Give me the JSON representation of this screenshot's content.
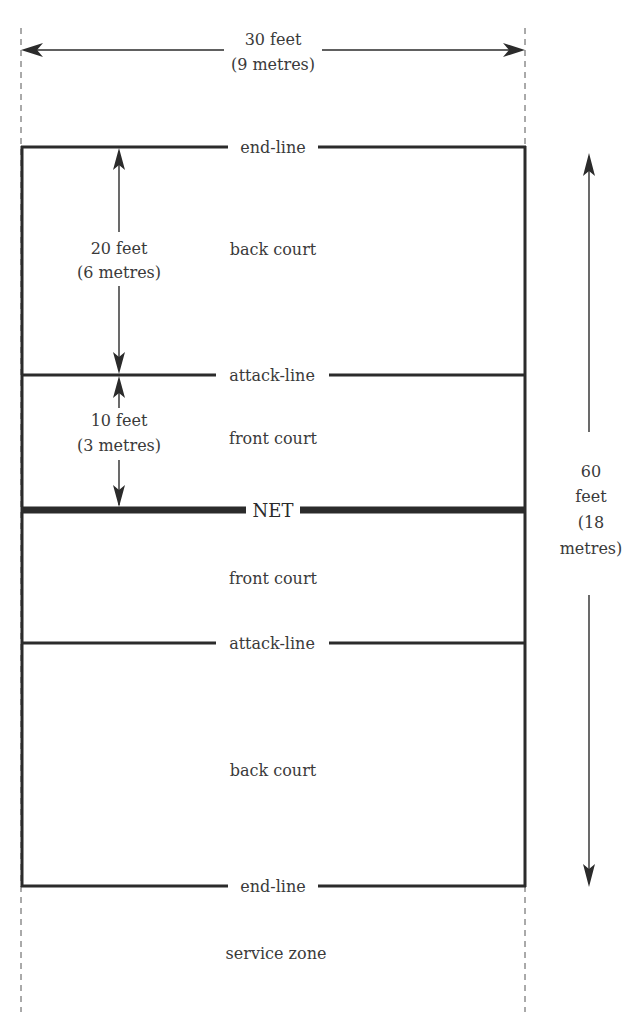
{
  "diagram": {
    "width_dimension": {
      "feet": "30 feet",
      "metres": "(9 metres)"
    },
    "length_dimension": {
      "line1": "60",
      "line2": "feet",
      "line3": "(18",
      "line4": "metres)"
    },
    "back_court_depth": {
      "feet": "20 feet",
      "metres": "(6 metres)"
    },
    "front_court_depth": {
      "feet": "10 feet",
      "metres": "(3 metres)"
    },
    "lines": {
      "top_end_line": "end-line",
      "top_attack_line": "attack-line",
      "net": "NET",
      "bottom_attack_line": "attack-line",
      "bottom_end_line": "end-line"
    },
    "zones": {
      "top_back_court": "back court",
      "top_front_court": "front court",
      "bottom_front_court": "front court",
      "bottom_back_court": "back court",
      "service_zone": "service zone"
    },
    "colors": {
      "line": "#2b2b2b",
      "text": "#3a3a3a",
      "background": "#ffffff"
    }
  }
}
